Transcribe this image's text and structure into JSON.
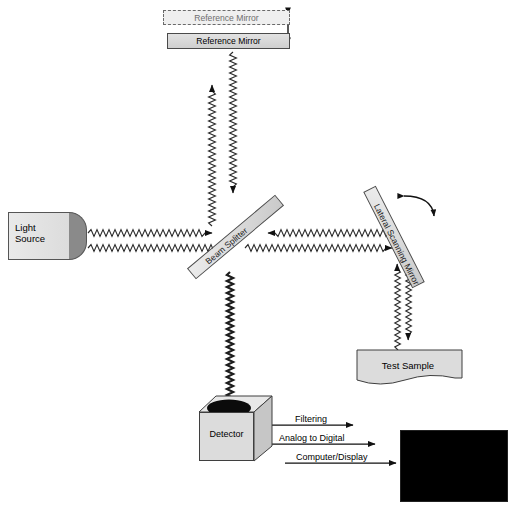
{
  "diagram": {
    "type": "optical-schematic"
  },
  "components": {
    "light_source": {
      "line1": "Light",
      "line2": "Source"
    },
    "reference_mirror_ghost": {
      "label": "Reference Mirror"
    },
    "reference_mirror": {
      "label": "Reference Mirror"
    },
    "beam_splitter": {
      "label": "Beam Splitter"
    },
    "scanning_mirror": {
      "label": "Lateral Scanning Mirror"
    },
    "test_sample": {
      "label": "Test Sample"
    },
    "detector": {
      "label": "Detector"
    },
    "display": {
      "label": ""
    }
  },
  "signal_chain": [
    {
      "label": "Filtering"
    },
    {
      "label": "Analog to Digital"
    },
    {
      "label": "Computer/Display"
    }
  ],
  "motion": {
    "reference_mirror_translation": "vertical double arrow",
    "scanning_mirror_rotation": "curved double arrow"
  },
  "colors": {
    "background": "#ffffff",
    "optic_fill": "#dcdcdc",
    "optic_stroke": "#4d4d4d",
    "source_cap": "#8a8a8a",
    "beam": "#2b2b2b",
    "display_background": "#000000",
    "display_ring": "#a8a8a8",
    "ghost_stroke": "#6a6a6a"
  }
}
